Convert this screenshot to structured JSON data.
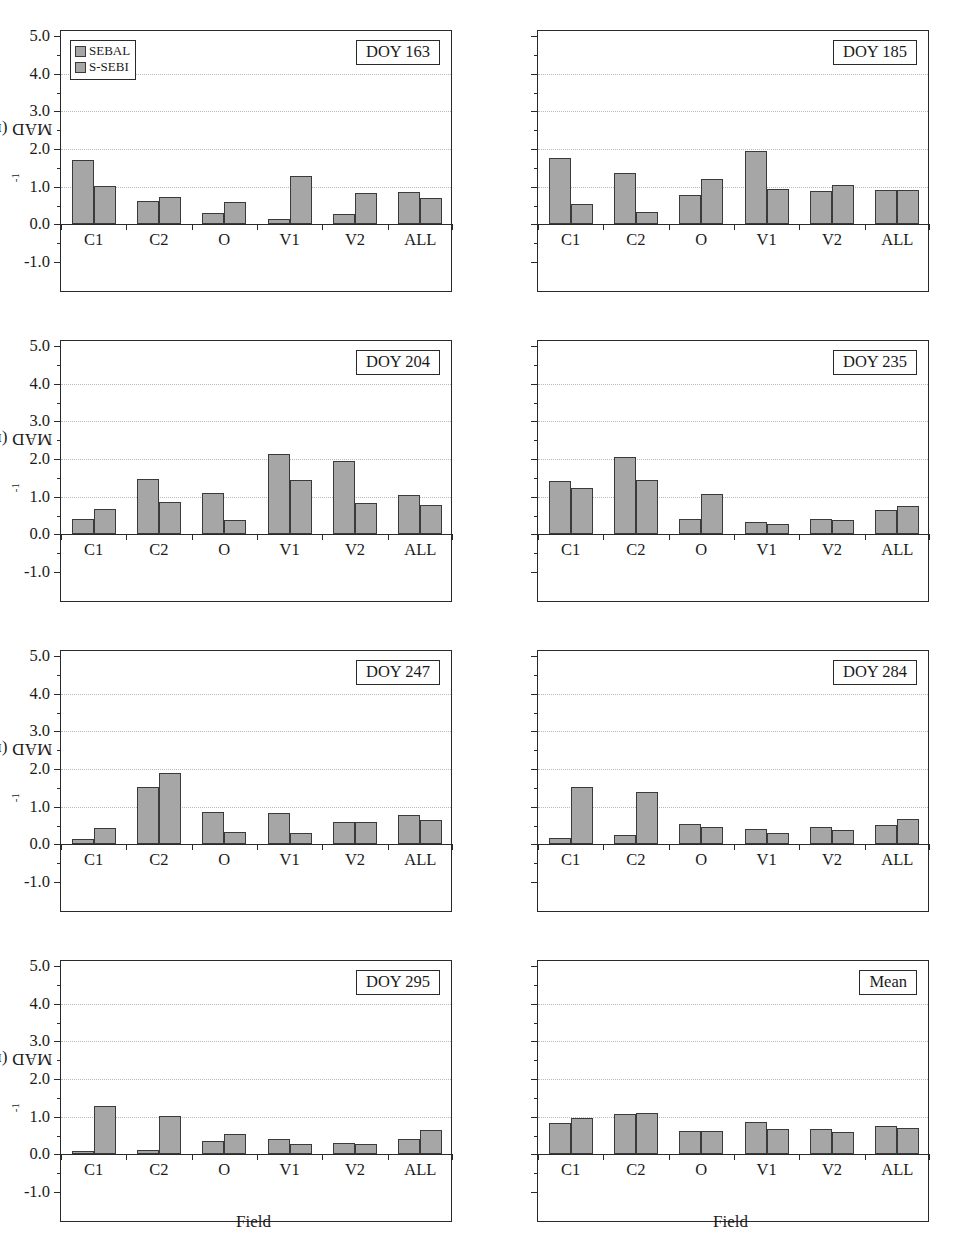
{
  "figure": {
    "ylabel_main": "MAD (mm day",
    "ylabel_sup": "-1",
    "ylabel_tail": ")",
    "xlabel": "Field",
    "legend": [
      {
        "key": "sebal",
        "label": "SEBAL",
        "color": "#a6a6a6"
      },
      {
        "key": "ssebi",
        "label": "S-SEBI",
        "color": "#a6a6a6"
      }
    ],
    "bar_color": "#a6a6a6",
    "bar_outline": "#3a3a3a",
    "axis_color": "#2a2a2a",
    "grid_color": "#b9b9b9"
  },
  "chart_data": {
    "type": "bar",
    "title": "",
    "xlabel": "Field",
    "ylabel": "MAD (mm day^-1)",
    "ylim": [
      -1.0,
      5.0
    ],
    "yticks": [
      "-1.0",
      "0.0",
      "1.0",
      "2.0",
      "3.0",
      "4.0",
      "5.0"
    ],
    "ytick_values": [
      -1.0,
      0.0,
      1.0,
      2.0,
      3.0,
      4.0,
      5.0
    ],
    "grid": true,
    "legend_position": "top-left (panel 1 only)",
    "categories": [
      "C1",
      "C2",
      "O",
      "V1",
      "V2",
      "ALL"
    ],
    "series_names": [
      "SEBAL",
      "S-SEBI"
    ],
    "panels": [
      {
        "label": "DOY 163",
        "series": [
          {
            "name": "SEBAL",
            "values": [
              1.72,
              0.62,
              0.3,
              0.13,
              0.27,
              0.85
            ]
          },
          {
            "name": "S-SEBI",
            "values": [
              1.02,
              0.72,
              0.58,
              1.28,
              0.84,
              0.7
            ]
          }
        ]
      },
      {
        "label": "DOY 185",
        "series": [
          {
            "name": "SEBAL",
            "values": [
              1.76,
              1.37,
              0.78,
              1.95,
              0.88,
              0.92
            ]
          },
          {
            "name": "S-SEBI",
            "values": [
              0.55,
              0.34,
              1.2,
              0.95,
              1.05,
              0.92
            ]
          }
        ]
      },
      {
        "label": "DOY 204",
        "series": [
          {
            "name": "SEBAL",
            "values": [
              0.41,
              1.46,
              1.11,
              2.13,
              1.94,
              1.04
            ]
          },
          {
            "name": "S-SEBI",
            "values": [
              0.66,
              0.85,
              0.39,
              1.45,
              0.82,
              0.77
            ]
          }
        ]
      },
      {
        "label": "DOY 235",
        "series": [
          {
            "name": "SEBAL",
            "values": [
              1.41,
              2.05,
              0.42,
              0.32,
              0.4,
              0.64
            ]
          },
          {
            "name": "S-SEBI",
            "values": [
              1.22,
              1.45,
              1.08,
              0.27,
              0.39,
              0.76
            ]
          }
        ]
      },
      {
        "label": "DOY 247",
        "series": [
          {
            "name": "SEBAL",
            "values": [
              0.13,
              1.53,
              0.87,
              0.84,
              0.6,
              0.79
            ]
          },
          {
            "name": "S-SEBI",
            "values": [
              0.44,
              1.89,
              0.33,
              0.31,
              0.58,
              0.64
            ]
          }
        ]
      },
      {
        "label": "DOY 284",
        "series": [
          {
            "name": "SEBAL",
            "values": [
              0.18,
              0.26,
              0.55,
              0.42,
              0.45,
              0.52
            ]
          },
          {
            "name": "S-SEBI",
            "values": [
              1.53,
              1.39,
              0.45,
              0.31,
              0.37,
              0.68
            ]
          }
        ]
      },
      {
        "label": "DOY 295",
        "series": [
          {
            "name": "SEBAL",
            "values": [
              0.09,
              0.11,
              0.35,
              0.4,
              0.3,
              0.41
            ]
          },
          {
            "name": "S-SEBI",
            "values": [
              1.28,
              1.03,
              0.55,
              0.27,
              0.27,
              0.64
            ]
          }
        ]
      },
      {
        "label": "Mean",
        "series": [
          {
            "name": "SEBAL",
            "values": [
              0.82,
              1.07,
              0.62,
              0.87,
              0.67,
              0.74
            ]
          },
          {
            "name": "S-SEBI",
            "values": [
              0.96,
              1.09,
              0.62,
              0.67,
              0.6,
              0.7
            ]
          }
        ]
      }
    ]
  }
}
